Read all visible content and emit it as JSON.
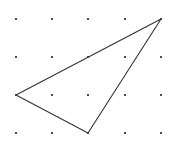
{
  "diagram": {
    "type": "dot-grid-triangle",
    "grid": {
      "rows": 4,
      "columns": 5,
      "x_positions": [
        16,
        52,
        88,
        125,
        161
      ],
      "y_positions": [
        19,
        57,
        95,
        133
      ],
      "dot_color": "#222222",
      "dot_radius": 1.1
    },
    "triangle": {
      "vertices_grid": [
        [
          4,
          0
        ],
        [
          0,
          2
        ],
        [
          2,
          3
        ]
      ],
      "stroke_color": "#333333",
      "stroke_width": 1.1
    }
  }
}
